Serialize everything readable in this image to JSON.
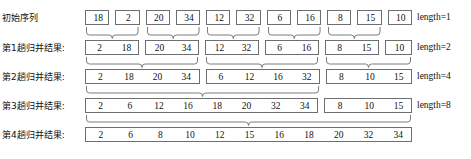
{
  "diagram": {
    "rows": [
      {
        "label": "初始序列",
        "length_label": "length=1",
        "groups": [
          [
            18
          ],
          [
            2
          ],
          [
            20
          ],
          [
            34
          ],
          [
            12
          ],
          [
            32
          ],
          [
            6
          ],
          [
            16
          ],
          [
            8
          ],
          [
            15
          ],
          [
            10
          ]
        ]
      },
      {
        "label": "第1趟归并结果:",
        "length_label": "length=2",
        "groups": [
          [
            2,
            18
          ],
          [
            20,
            34
          ],
          [
            12,
            32
          ],
          [
            6,
            16
          ],
          [
            8,
            15
          ],
          [
            10
          ]
        ]
      },
      {
        "label": "第2趟归并结果:",
        "length_label": "length=4",
        "groups": [
          [
            2,
            18,
            20,
            34
          ],
          [
            6,
            12,
            16,
            32
          ],
          [
            8,
            10,
            15
          ]
        ]
      },
      {
        "label": "第3趟归并结果:",
        "length_label": "length=8",
        "groups": [
          [
            2,
            6,
            12,
            16,
            18,
            20,
            32,
            34
          ],
          [
            8,
            10,
            15
          ]
        ]
      },
      {
        "label": "第4趟归并结果:",
        "length_label": "",
        "groups": [
          [
            2,
            6,
            8,
            10,
            12,
            15,
            16,
            18,
            20,
            32,
            34
          ]
        ]
      }
    ],
    "colors": {
      "box_border": "#6e6e6e",
      "text": "#111111",
      "background": "#ffffff"
    }
  }
}
